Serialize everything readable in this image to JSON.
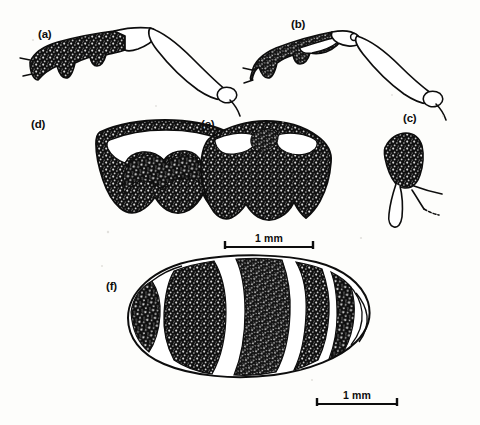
{
  "figure": {
    "kind": "scientific-illustration-plate",
    "medium": "scanned line drawing with stipple shading",
    "background_color": "#fdfdfb",
    "ink_color": "#0d0d0d",
    "panel_count": 6
  },
  "panels": [
    {
      "id": "a",
      "label": "(a)",
      "label_x": 38,
      "label_y": 28,
      "subject": "hind leg, lateral view - dark stippled femur with pale tibia and tarsus",
      "shaded": true
    },
    {
      "id": "b",
      "label": "(b)",
      "label_x": 291,
      "label_y": 18,
      "subject": "hind leg, lateral view - dark stippled femur with pale tibia and tarsus",
      "shaded": true
    },
    {
      "id": "c",
      "label": "(c)",
      "label_x": 403,
      "label_y": 112,
      "subject": "small sclerite with two slender projections",
      "shaded": true
    },
    {
      "id": "d",
      "label": "(d)",
      "label_x": 31,
      "label_y": 118,
      "subject": "scutum, dorsal view - dark margin enclosing a broad pale transverse band",
      "shaded": true
    },
    {
      "id": "e",
      "label": "(e)",
      "label_x": 201,
      "label_y": 118,
      "subject": "scutum, dorsal view - dark with two pale oval spots anteriorly",
      "shaded": true
    },
    {
      "id": "f",
      "label": "(f)",
      "label_x": 106,
      "label_y": 280,
      "subject": "abdomen, dorsal view - oval with alternating dark and pale transverse bands",
      "shaded": true
    }
  ],
  "scale_bars": [
    {
      "id": "scale-top",
      "label": "1 mm",
      "x": 224,
      "y": 247,
      "length_px": 90,
      "label_x": 224,
      "label_y": 233
    },
    {
      "id": "scale-bottom",
      "label": "1 mm",
      "x": 316,
      "y": 404,
      "length_px": 82,
      "label_x": 316,
      "label_y": 390
    }
  ]
}
